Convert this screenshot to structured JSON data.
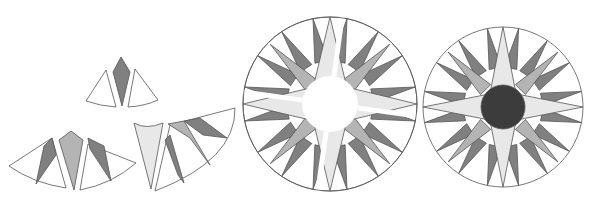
{
  "diagram": {
    "colors": {
      "white": "#ffffff",
      "dark": "#808080",
      "medium": "#b4b4b4",
      "light": "#e8e8e8",
      "center": "#3c3c3c",
      "stroke": "#555555"
    },
    "steps": [
      {
        "id": "step-1",
        "label": "single point unit"
      },
      {
        "id": "step-2",
        "label": "joined point units"
      },
      {
        "id": "step-3",
        "label": "quarter unit with large point"
      },
      {
        "id": "step-4",
        "label": "quarters assembled with open center"
      },
      {
        "id": "step-5",
        "label": "finished compass with center circle"
      }
    ]
  }
}
